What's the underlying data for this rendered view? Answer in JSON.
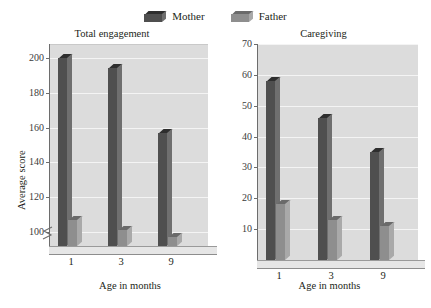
{
  "legend": {
    "items": [
      {
        "label": "Mother",
        "key": "mother",
        "color": "#4f4f4f"
      },
      {
        "label": "Father",
        "key": "father",
        "color": "#8e8e8e"
      }
    ]
  },
  "colors": {
    "mother_face": "#4f4f4f",
    "mother_top": "#2e2e2e",
    "mother_side": "#6f6f6f",
    "father_face": "#8e8e8e",
    "father_top": "#6a6a6a",
    "father_side": "#a9a9a9",
    "plot_background": "#dcdcdc",
    "gridline": "#f4f4f4",
    "axis": "#6d6d6d",
    "text": "#231f20",
    "floor": "#e6e6e6"
  },
  "chart_data": [
    {
      "type": "bar",
      "title": "Total engagement",
      "xlabel": "Age in months",
      "ylabel": "Average score",
      "categories": [
        "1",
        "3",
        "9"
      ],
      "series": [
        {
          "name": "Mother",
          "values": [
            200,
            194,
            157
          ]
        },
        {
          "name": "Father",
          "values": [
            107,
            101,
            97
          ]
        }
      ],
      "yticks": [
        100,
        120,
        140,
        160,
        180,
        200
      ],
      "ylim": [
        92,
        208
      ],
      "axis_break": true,
      "grid": true,
      "legend_position": "top"
    },
    {
      "type": "bar",
      "title": "Caregiving",
      "xlabel": "Age in months",
      "ylabel": "",
      "categories": [
        "1",
        "3",
        "9"
      ],
      "series": [
        {
          "name": "Mother",
          "values": [
            58,
            46,
            35
          ]
        },
        {
          "name": "Father",
          "values": [
            18,
            13,
            11
          ]
        }
      ],
      "yticks": [
        10,
        20,
        30,
        40,
        50,
        60,
        70
      ],
      "ylim": [
        0,
        70
      ],
      "axis_break": false,
      "grid": true,
      "legend_position": "top"
    }
  ]
}
